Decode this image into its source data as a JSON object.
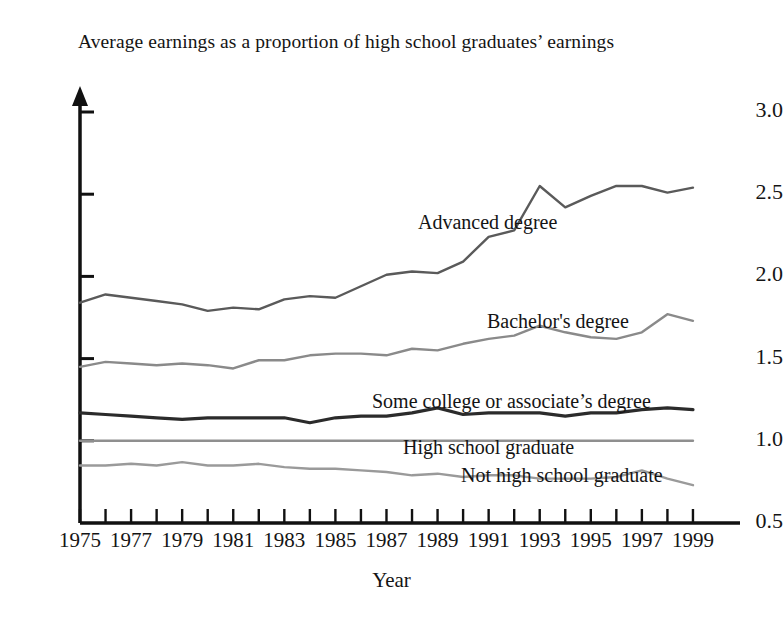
{
  "chart_data": {
    "type": "line",
    "title": "Average earnings as a proportion of high school graduates’ earnings",
    "xlabel": "Year",
    "ylabel": "",
    "xlim": [
      1975,
      1999
    ],
    "ylim": [
      0.5,
      3.0
    ],
    "grid": false,
    "legend_position": "inline-labels",
    "ytick_labels": [
      "3.0",
      "2.5",
      "2.0",
      "1.5",
      "1.0",
      "0.5"
    ],
    "ytick_values": [
      3.0,
      2.5,
      2.0,
      1.5,
      1.0,
      0.5
    ],
    "xtick_labels": [
      "1975",
      "1977",
      "1979",
      "1981",
      "1983",
      "1985",
      "1987",
      "1989",
      "1991",
      "1993",
      "1995",
      "1997",
      "1999"
    ],
    "xtick_values": [
      1975,
      1977,
      1979,
      1981,
      1983,
      1985,
      1987,
      1989,
      1991,
      1993,
      1995,
      1997,
      1999
    ],
    "minor_xticks_every": 1,
    "x": [
      1975,
      1976,
      1977,
      1978,
      1979,
      1980,
      1981,
      1982,
      1983,
      1984,
      1985,
      1986,
      1987,
      1988,
      1989,
      1990,
      1991,
      1992,
      1993,
      1994,
      1995,
      1996,
      1997,
      1998,
      1999
    ],
    "series": [
      {
        "name": "Advanced degree",
        "color": "#5a5a5a",
        "label_x": 418,
        "label_y": 211,
        "values": [
          1.84,
          1.89,
          1.87,
          1.85,
          1.83,
          1.79,
          1.81,
          1.8,
          1.86,
          1.88,
          1.87,
          1.94,
          2.01,
          2.03,
          2.02,
          2.09,
          2.24,
          2.28,
          2.55,
          2.42,
          2.49,
          2.55,
          2.55,
          2.51,
          2.54
        ]
      },
      {
        "name": "Bachelor's degree",
        "color": "#8a8a8a",
        "label_x": 487,
        "label_y": 310,
        "values": [
          1.45,
          1.48,
          1.47,
          1.46,
          1.47,
          1.46,
          1.44,
          1.49,
          1.49,
          1.52,
          1.53,
          1.53,
          1.52,
          1.56,
          1.55,
          1.59,
          1.62,
          1.64,
          1.7,
          1.66,
          1.63,
          1.62,
          1.66,
          1.77,
          1.73
        ]
      },
      {
        "name": "Some college or associate’s degree",
        "color": "#2b2b2b",
        "label_x": 372,
        "label_y": 390,
        "values": [
          1.17,
          1.16,
          1.15,
          1.14,
          1.13,
          1.14,
          1.14,
          1.14,
          1.14,
          1.11,
          1.14,
          1.15,
          1.15,
          1.17,
          1.2,
          1.16,
          1.17,
          1.17,
          1.17,
          1.15,
          1.17,
          1.17,
          1.19,
          1.2,
          1.19
        ]
      },
      {
        "name": "High school graduate",
        "color": "#8f8f8f",
        "label_x": 403,
        "label_y": 436,
        "values": [
          1.0,
          1.0,
          1.0,
          1.0,
          1.0,
          1.0,
          1.0,
          1.0,
          1.0,
          1.0,
          1.0,
          1.0,
          1.0,
          1.0,
          1.0,
          1.0,
          1.0,
          1.0,
          1.0,
          1.0,
          1.0,
          1.0,
          1.0,
          1.0,
          1.0
        ]
      },
      {
        "name": "Not high school graduate",
        "color": "#9a9a9a",
        "label_x": 461,
        "label_y": 464,
        "values": [
          0.85,
          0.85,
          0.86,
          0.85,
          0.87,
          0.85,
          0.85,
          0.86,
          0.84,
          0.83,
          0.83,
          0.82,
          0.81,
          0.79,
          0.8,
          0.78,
          0.79,
          0.79,
          0.77,
          0.77,
          0.77,
          0.78,
          0.82,
          0.77,
          0.73
        ]
      }
    ]
  },
  "axes": {
    "x_origin_px": 80,
    "y_baseline_px": 523,
    "x_right_px": 740,
    "y_top_px": 75,
    "px_per_year": 25.54,
    "px_per_half_unit": 82.2,
    "axis_color": "#111111"
  }
}
